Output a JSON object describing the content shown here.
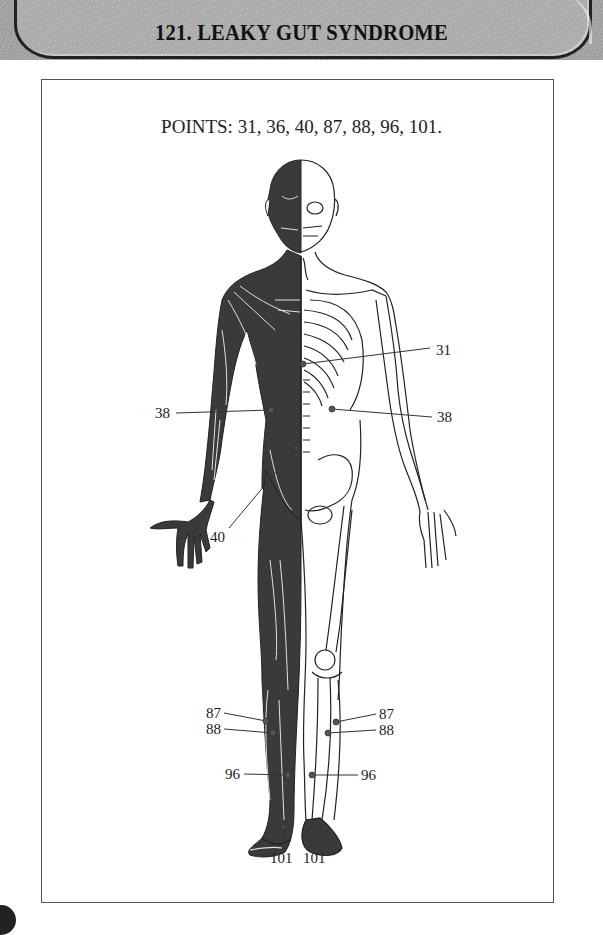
{
  "header": {
    "title": "121. LEAKY GUT SYNDROME"
  },
  "diagram": {
    "points_caption": "POINTS: 31, 36, 40, 87, 88, 96, 101.",
    "figure_description": "Front anatomical figure; left half shows musculature, right half shows skeleton",
    "labels": [
      {
        "id": "31",
        "text": "31",
        "side": "right",
        "label_x": 436,
        "label_y": 355,
        "point_x": 303,
        "point_y": 364
      },
      {
        "id": "38-left",
        "text": "38",
        "side": "left",
        "label_x": 155,
        "label_y": 418,
        "point_x": 271,
        "point_y": 410
      },
      {
        "id": "38-right",
        "text": "38",
        "side": "right",
        "label_x": 437,
        "label_y": 422,
        "point_x": 332,
        "point_y": 409
      },
      {
        "id": "40",
        "text": "40",
        "side": "left",
        "label_x": 210,
        "label_y": 542,
        "point_x": 296,
        "point_y": 448
      },
      {
        "id": "87-left",
        "text": "87",
        "side": "left",
        "label_x": 206,
        "label_y": 718,
        "point_x": 266,
        "point_y": 721
      },
      {
        "id": "88-left",
        "text": "88",
        "side": "left",
        "label_x": 206,
        "label_y": 734,
        "point_x": 273,
        "point_y": 733
      },
      {
        "id": "87-right",
        "text": "87",
        "side": "right",
        "label_x": 379,
        "label_y": 719,
        "point_x": 336,
        "point_y": 722
      },
      {
        "id": "88-right",
        "text": "88",
        "side": "right",
        "label_x": 379,
        "label_y": 735,
        "point_x": 328,
        "point_y": 733
      },
      {
        "id": "96-left",
        "text": "96",
        "side": "left",
        "label_x": 225,
        "label_y": 779,
        "point_x": 288,
        "point_y": 775
      },
      {
        "id": "96-right",
        "text": "96",
        "side": "right",
        "label_x": 361,
        "label_y": 780,
        "point_x": 312,
        "point_y": 775
      },
      {
        "id": "101-left",
        "text": "101",
        "side": "bottom",
        "label_x": 270,
        "label_y": 863,
        "point_x": 283,
        "point_y": 827
      },
      {
        "id": "101-right",
        "text": "101",
        "side": "bottom",
        "label_x": 303,
        "label_y": 863,
        "point_x": 310,
        "point_y": 845
      }
    ]
  },
  "colors": {
    "header_band": "#a9a9a9",
    "ink": "#222222",
    "muscle_fill": "#3a3a3a",
    "point_marker": "#555555"
  }
}
